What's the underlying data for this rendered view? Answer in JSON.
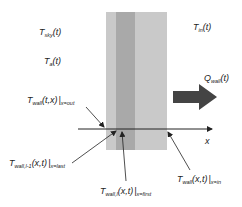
{
  "diagram": {
    "type": "wall heat transfer schematic",
    "colors": {
      "background": "#ffffff",
      "wall_light": "#c9c9c9",
      "wall_dark": "#a9a9a9",
      "arrow": "#444444",
      "lines": "#222222",
      "text": "#222222"
    },
    "labels": {
      "t_sky": {
        "main": "T",
        "sub": "sky",
        "tail": "(t)"
      },
      "t_a": {
        "main": "T",
        "sub": "a",
        "tail": "(t)"
      },
      "t_wall_out": {
        "main": "T",
        "sub": "wall",
        "tail": "(t,x)",
        "bar": "|",
        "cond": "x=out"
      },
      "t_in": {
        "main": "T",
        "sub": "in",
        "tail": "(t)"
      },
      "q_wall": {
        "main": "Q",
        "sub": "wall",
        "tail": "(t)"
      },
      "t_wall_last": {
        "main": "T",
        "sub": "wall,l-1",
        "tail": "(x,t)",
        "bar": "|",
        "cond": "x=last"
      },
      "t_wall_first": {
        "main": "T",
        "sub": "wall,l",
        "tail": "(x,t)",
        "bar": "|",
        "cond": "x=first"
      },
      "t_wall_in": {
        "main": "T",
        "sub": "wall",
        "tail": "(x,t)",
        "bar": "|",
        "cond": "x=in"
      },
      "x_axis": "x"
    }
  }
}
